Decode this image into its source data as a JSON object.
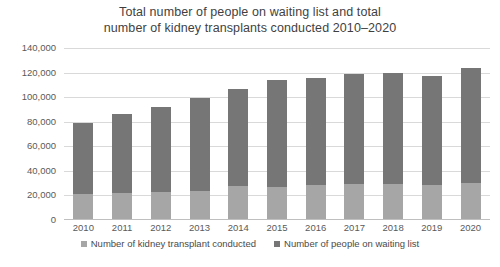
{
  "chart_data": {
    "type": "bar",
    "title": "Total number of people on waiting list and total number of kidney transplants conducted 2010–2020",
    "title_line1": "Total number of people on waiting list and total",
    "title_line2": "number of kidney transplants conducted 2010–2020",
    "xlabel": "",
    "ylabel": "",
    "ylim": [
      0,
      140000
    ],
    "ytick_labels": [
      "140,000",
      "120,000",
      "100,000",
      "80,000",
      "60,000",
      "40,000",
      "20,000",
      "0"
    ],
    "ytick_values": [
      140000,
      120000,
      100000,
      80000,
      60000,
      40000,
      20000,
      0
    ],
    "grid": true,
    "stacked": true,
    "legend_position": "bottom",
    "categories": [
      "2010",
      "2011",
      "2012",
      "2013",
      "2014",
      "2015",
      "2016",
      "2017",
      "2018",
      "2019",
      "2020"
    ],
    "series": [
      {
        "name": "Number of kidney transplant conducted",
        "color": "#a6a6a6",
        "values": [
          21000,
          22000,
          23000,
          24000,
          28000,
          27000,
          28500,
          29000,
          29500,
          28500,
          30000
        ]
      },
      {
        "name": "Number of people on waiting list",
        "color": "#767676",
        "values": [
          58000,
          64000,
          69000,
          75000,
          79000,
          87000,
          87000,
          90000,
          90500,
          89000,
          94000
        ]
      }
    ],
    "totals": [
      79000,
      86000,
      92000,
      99000,
      107000,
      114000,
      115500,
      119000,
      120000,
      117500,
      124000
    ]
  },
  "legend": {
    "items": [
      {
        "label": "Number of kidney transplant conducted",
        "color": "#a6a6a6"
      },
      {
        "label": "Number of people on waiting list",
        "color": "#767676"
      }
    ]
  },
  "caption": {
    "text": ""
  }
}
